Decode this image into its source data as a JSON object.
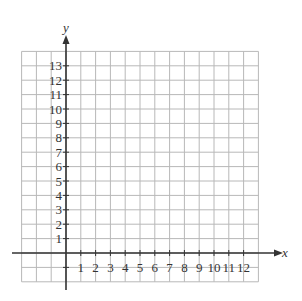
{
  "chart_data": {
    "type": "grid",
    "title": "",
    "xlabel": "x",
    "ylabel": "y",
    "x_ticks": [
      "1",
      "2",
      "3",
      "4",
      "5",
      "6",
      "7",
      "8",
      "9",
      "10",
      "11",
      "12"
    ],
    "y_ticks": [
      "1",
      "2",
      "3",
      "4",
      "5",
      "6",
      "7",
      "8",
      "9",
      "10",
      "11",
      "12",
      "13"
    ],
    "xlim": [
      -3,
      13
    ],
    "ylim": [
      -2,
      14
    ],
    "grid": true,
    "series": []
  },
  "labels": {
    "x_axis": "x",
    "y_axis": "y"
  },
  "colors": {
    "grid": "#b8b8b8",
    "axis": "#333333",
    "text": "#333333"
  }
}
